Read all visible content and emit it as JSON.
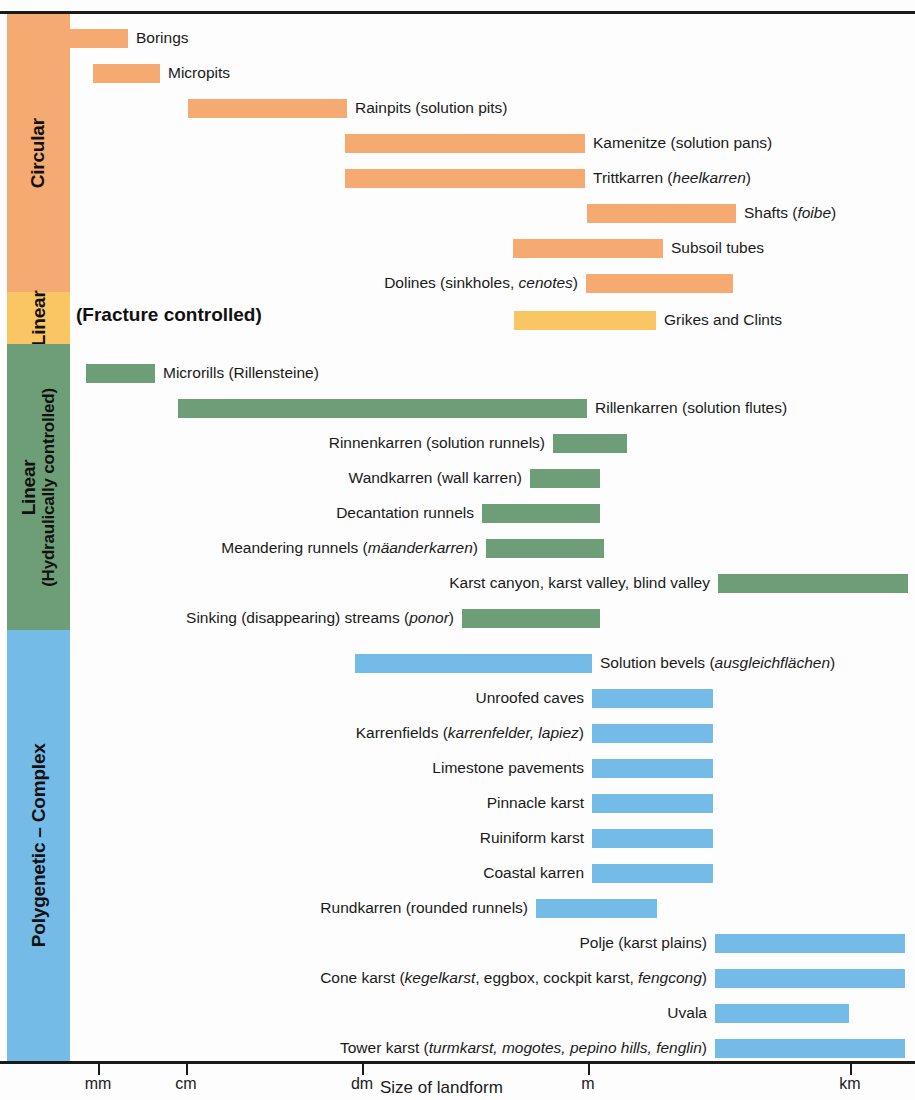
{
  "axis": {
    "title": "Size of landform",
    "ticks": [
      {
        "label": "mm",
        "x": 98
      },
      {
        "label": "cm",
        "x": 186
      },
      {
        "label": "dm",
        "x": 362
      },
      {
        "label": "m",
        "x": 588
      },
      {
        "label": "km",
        "x": 850
      }
    ]
  },
  "categories": [
    {
      "id": "circular",
      "label": "Circular",
      "sublabel": "",
      "color": "#F4AA70",
      "top": 14,
      "height": 278
    },
    {
      "id": "linear-frac",
      "label": "Linear",
      "sublabel": "",
      "color": "#FAC563",
      "top": 292,
      "height": 52
    },
    {
      "id": "linear-hyd",
      "label": "Linear",
      "sublabel": "(Hydraulically controlled)",
      "color": "#6E9E77",
      "top": 344,
      "height": 286
    },
    {
      "id": "polygenetic",
      "label": "Polygenetic – Complex",
      "sublabel": "",
      "color": "#74BBE8",
      "top": 630,
      "height": 431
    }
  ],
  "fracture_heading": "(Fracture controlled)",
  "colors": {
    "circular": "#F4AA70",
    "linear_fracture": "#FAC563",
    "linear_hydraulic": "#6E9E77",
    "polygenetic": "#74BBE8",
    "text": "#1a1a1a"
  },
  "chart_data": {
    "type": "bar",
    "title": "",
    "xlabel": "Size of landform",
    "ylabel": "",
    "orientation": "horizontal-ranges",
    "x_scale": "logarithmic",
    "x_tick_labels": [
      "mm",
      "cm",
      "dm",
      "m",
      "km"
    ],
    "x_tick_px": [
      98,
      186,
      362,
      588,
      850
    ],
    "grid": false,
    "legend": "none",
    "groups": [
      {
        "name": "Circular",
        "color": "#F4AA70",
        "items": [
          {
            "label": "Borings",
            "label_side": "right",
            "start_px": 70,
            "end_px": 128,
            "start_unit": "mm",
            "end_unit": "mm"
          },
          {
            "label": "Micropits",
            "label_side": "right",
            "start_px": 93,
            "end_px": 160,
            "start_unit": "mm",
            "end_unit": "cm"
          },
          {
            "label": "Rainpits (solution pits)",
            "label_side": "right",
            "start_px": 188,
            "end_px": 347
          },
          {
            "label": "Kamenitze (solution pans)",
            "label_side": "right",
            "start_px": 345,
            "end_px": 585
          },
          {
            "label": "Trittkarren (<i>heelkarren</i>)",
            "label_side": "right",
            "start_px": 345,
            "end_px": 585
          },
          {
            "label": "Shafts (<i>foibe</i>)",
            "label_side": "right",
            "start_px": 587,
            "end_px": 736
          },
          {
            "label": "Subsoil tubes",
            "label_side": "right",
            "start_px": 513,
            "end_px": 663
          },
          {
            "label": "Dolines (sinkholes, <i>cenotes</i>)",
            "label_side": "left",
            "start_px": 586,
            "end_px": 733
          }
        ]
      },
      {
        "name": "Linear (Fracture controlled)",
        "color": "#FAC563",
        "items": [
          {
            "label": "Grikes and Clints",
            "label_side": "right",
            "start_px": 514,
            "end_px": 656
          }
        ]
      },
      {
        "name": "Linear (Hydraulically controlled)",
        "color": "#6E9E77",
        "items": [
          {
            "label": "Microrills (Rillensteine)",
            "label_side": "right",
            "start_px": 86,
            "end_px": 155
          },
          {
            "label": "Rillenkarren (solution flutes)",
            "label_side": "right",
            "start_px": 178,
            "end_px": 587
          },
          {
            "label": "Rinnenkarren (solution runnels)",
            "label_side": "left",
            "start_px": 553,
            "end_px": 627
          },
          {
            "label": "Wandkarren (wall karren)",
            "label_side": "left",
            "start_px": 530,
            "end_px": 600
          },
          {
            "label": "Decantation runnels",
            "label_side": "left",
            "start_px": 482,
            "end_px": 600
          },
          {
            "label": "Meandering runnels (<i>mäanderkarren</i>)",
            "label_side": "left",
            "start_px": 486,
            "end_px": 604
          },
          {
            "label": "Karst canyon, karst valley, blind valley",
            "label_side": "left",
            "start_px": 718,
            "end_px": 908
          },
          {
            "label": "Sinking (disappearing) streams (<i>ponor</i>)",
            "label_side": "left",
            "start_px": 462,
            "end_px": 600
          }
        ]
      },
      {
        "name": "Polygenetic – Complex",
        "color": "#74BBE8",
        "items": [
          {
            "label": "Solution bevels (<i>ausgleichflächen</i>)",
            "label_side": "right",
            "start_px": 355,
            "end_px": 592
          },
          {
            "label": "Unroofed caves",
            "label_side": "left",
            "start_px": 592,
            "end_px": 713
          },
          {
            "label": "Karrenfields (<i>karrenfelder, lapiez</i>)",
            "label_side": "left",
            "start_px": 592,
            "end_px": 713
          },
          {
            "label": "Limestone pavements",
            "label_side": "left",
            "start_px": 592,
            "end_px": 713
          },
          {
            "label": "Pinnacle karst",
            "label_side": "left",
            "start_px": 592,
            "end_px": 713
          },
          {
            "label": "Ruiniform karst",
            "label_side": "left",
            "start_px": 592,
            "end_px": 713
          },
          {
            "label": "Coastal karren",
            "label_side": "left",
            "start_px": 592,
            "end_px": 713
          },
          {
            "label": "Rundkarren (rounded runnels)",
            "label_side": "left",
            "start_px": 536,
            "end_px": 657
          },
          {
            "label": "Polje (karst plains)",
            "label_side": "left",
            "start_px": 715,
            "end_px": 905
          },
          {
            "label": "Cone karst (<i>kegelkarst</i>, eggbox, cockpit karst, <i>fengcong</i>)",
            "label_side": "left",
            "start_px": 715,
            "end_px": 905
          },
          {
            "label": "Uvala",
            "label_side": "left",
            "start_px": 715,
            "end_px": 849
          },
          {
            "label": "Tower karst (<i>turmkarst, mogotes, pepino hills, fenglin</i>)",
            "label_side": "left",
            "start_px": 715,
            "end_px": 905
          }
        ]
      }
    ],
    "row_tops_px": [
      25,
      60,
      95,
      130,
      165,
      200,
      235,
      270,
      307,
      360,
      395,
      430,
      465,
      500,
      535,
      570,
      605,
      650,
      685,
      720,
      755,
      790,
      825,
      860,
      895,
      930,
      965,
      1000,
      1035
    ]
  }
}
